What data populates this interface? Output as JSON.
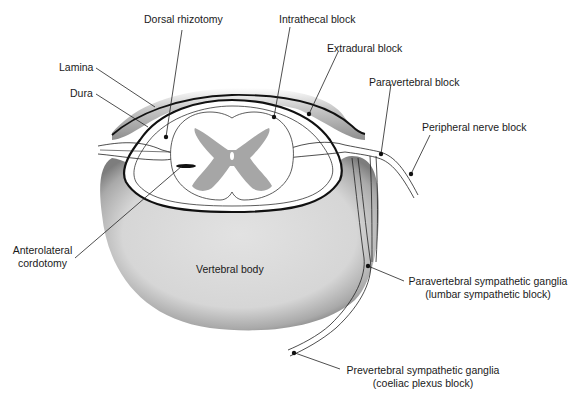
{
  "diagram": {
    "colors": {
      "outline": "#111111",
      "grey_matter": "#a6a6a6",
      "bone_fill": "#dcdcdc",
      "bone_shadow": "#8a8a8a",
      "background": "#ffffff"
    },
    "labels": {
      "dorsal_rhizotomy": "Dorsal rhizotomy",
      "intrathecal_block": "Intrathecal block",
      "extradural_block": "Extradural block",
      "lamina": "Lamina",
      "dura": "Dura",
      "paravertebral_block": "Paravertebral block",
      "peripheral_nerve_block": "Peripheral nerve block",
      "anterolateral_cordotomy_1": "Anterolateral",
      "anterolateral_cordotomy_2": "cordotomy",
      "vertebral_body": "Vertebral body",
      "paravertebral_ganglia_1": "Paravertebral sympathetic ganglia",
      "paravertebral_ganglia_2": "(lumbar sympathetic block)",
      "prevertebral_ganglia_1": "Prevertebral sympathetic ganglia",
      "prevertebral_ganglia_2": "(coeliac plexus block)"
    }
  }
}
